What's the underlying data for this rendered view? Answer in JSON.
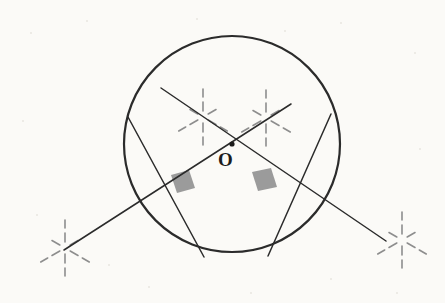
{
  "figure": {
    "type": "geometry-construction-diagram",
    "background_color": "#fbfaf7",
    "stroke_color": "#2b2b2b",
    "construction_color": "#8d8d8d",
    "right_angle_fill": "#9b9b9b"
  },
  "labels": {
    "center": "O"
  },
  "circle": {
    "cx": 232,
    "cy": 144,
    "r": 108,
    "stroke_width": 2.2
  },
  "center_point": {
    "cx": 232,
    "cy": 144,
    "r": 2.6
  },
  "chords": [
    {
      "name": "left-chord",
      "x1": 128,
      "y1": 117,
      "x2": 204,
      "y2": 257
    },
    {
      "name": "right-chord",
      "x1": 331,
      "y1": 114,
      "x2": 268,
      "y2": 256
    }
  ],
  "secants": [
    {
      "name": "secant-lower-left-to-upper-right",
      "x1": 64,
      "y1": 250,
      "x2": 291,
      "y2": 104
    },
    {
      "name": "secant-upper-left-to-lower-right",
      "x1": 161,
      "y1": 88,
      "x2": 386,
      "y2": 241
    }
  ],
  "right_angle_marks": [
    {
      "name": "left-right-angle-mark",
      "points": "171,175 189,170 195,188 177,193"
    },
    {
      "name": "right-right-angle-mark",
      "points": "252,172 271,168 277,187 258,191"
    }
  ],
  "starbursts": [
    {
      "name": "starburst-upper-left",
      "cx": 203,
      "cy": 117
    },
    {
      "name": "starburst-upper-right",
      "cx": 266,
      "cy": 118
    },
    {
      "name": "starburst-lower-left",
      "cx": 65,
      "cy": 248
    },
    {
      "name": "starburst-lower-right",
      "cx": 402,
      "cy": 240
    }
  ],
  "starburst_rays": [
    {
      "angle": -90,
      "inner": 6,
      "outer": 15
    },
    {
      "angle": -30,
      "inner": 6,
      "outer": 15
    },
    {
      "angle": 30,
      "inner": 6,
      "outer": 15
    },
    {
      "angle": 90,
      "inner": 6,
      "outer": 15
    },
    {
      "angle": 150,
      "inner": 6,
      "outer": 15
    },
    {
      "angle": 210,
      "inner": 6,
      "outer": 15
    },
    {
      "angle": -90,
      "inner": 20,
      "outer": 28
    },
    {
      "angle": 30,
      "inner": 20,
      "outer": 28
    },
    {
      "angle": 90,
      "inner": 20,
      "outer": 28
    },
    {
      "angle": 150,
      "inner": 20,
      "outer": 28
    }
  ],
  "specks": [
    {
      "x": 30,
      "y": 32,
      "w": 2,
      "h": 2
    },
    {
      "x": 86,
      "y": 20,
      "w": 2,
      "h": 2
    },
    {
      "x": 196,
      "y": 18,
      "w": 2,
      "h": 2
    },
    {
      "x": 284,
      "y": 30,
      "w": 2,
      "h": 2
    },
    {
      "x": 340,
      "y": 22,
      "w": 2,
      "h": 2
    },
    {
      "x": 414,
      "y": 52,
      "w": 2,
      "h": 2
    },
    {
      "x": 22,
      "y": 120,
      "w": 2,
      "h": 2
    },
    {
      "x": 419,
      "y": 148,
      "w": 2,
      "h": 2
    },
    {
      "x": 36,
      "y": 214,
      "w": 2,
      "h": 2
    },
    {
      "x": 148,
      "y": 286,
      "w": 2,
      "h": 2
    },
    {
      "x": 250,
      "y": 292,
      "w": 2,
      "h": 2
    },
    {
      "x": 330,
      "y": 278,
      "w": 2,
      "h": 2
    },
    {
      "x": 396,
      "y": 292,
      "w": 2,
      "h": 2
    },
    {
      "x": 108,
      "y": 264,
      "w": 2,
      "h": 2
    }
  ]
}
